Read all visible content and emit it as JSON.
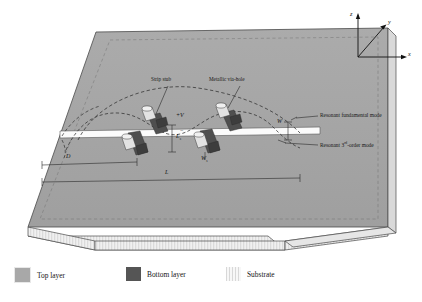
{
  "figure": {
    "axes": {
      "z_label": "z",
      "y_label": "y",
      "x_label": "x"
    },
    "callouts": {
      "strip_stub": "Strip stub",
      "via_hole": "Metallic via-hole",
      "fundamental_mode": "Resonant fundamental mode",
      "third_order_mode_prefix": "Resonant ",
      "third_order_mode_sup": "rd",
      "third_order_mode_suffix": "-order mode",
      "third_order_mode_num": "3"
    },
    "dimensions": {
      "d": "D",
      "l": "L",
      "l_s_base": "L",
      "l_s_sub": "s",
      "w": "W",
      "w_s_base": "W",
      "w_s_sub": "s"
    },
    "polarity": {
      "positive": "+V",
      "negative": "−"
    },
    "colors": {
      "top_layer": "#a8a8a8",
      "bottom_layer": "#555555",
      "substrate": "#f2f2f2",
      "slot": "#fbfbfb",
      "outline": "#4a4a4a",
      "dashed_mode": "#3a3a3a"
    }
  },
  "legend": {
    "items": [
      {
        "label": "Top layer",
        "swatch": "top-layer-swatch"
      },
      {
        "label": "Bottom layer",
        "swatch": "bottom-layer-swatch"
      },
      {
        "label": "Substrate",
        "swatch": "substrate-swatch"
      }
    ]
  }
}
